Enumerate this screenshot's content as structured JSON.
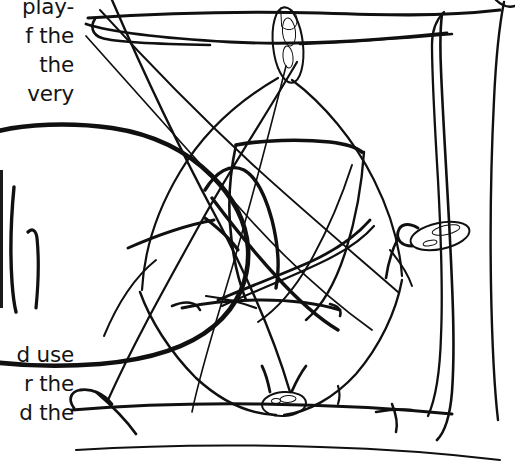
{
  "page": {
    "width": 515,
    "height": 468,
    "background_color": "#ffffff",
    "ink_color": "#101010",
    "text_color": "#141414"
  },
  "text_upper": {
    "name": "clipped-paragraph-upper",
    "note": "Left-clipped body text running down the left margin; only the right-hand ends of the lines are visible.",
    "lines": [
      "play-",
      "f the",
      "the",
      "very"
    ]
  },
  "text_lower": {
    "name": "clipped-paragraph-lower",
    "note": "Second left-clipped body text block below the drawing blob.",
    "lines": [
      "d use",
      "r the",
      "d the"
    ]
  },
  "drawing": {
    "name": "hand-drawn-ink-sketch",
    "description": "Loose ballpoint/ink sketch: an irregular frame of long wavering lines with crossing diagonals, a large closed blob outline at the left, an angular tangle of strokes at the centre, and three heavy solid ink blobs (top centre, right, bottom centre).",
    "stroke_color": "#101010",
    "blob_fill_color": "#0d0d0d",
    "elements": [
      {
        "label": "top-horizontal-rules",
        "type": "stroke-group",
        "count": 3
      },
      {
        "label": "left-closed-blob-outline",
        "type": "closed-outline"
      },
      {
        "label": "left-short-vertical-strokes",
        "type": "stroke-group",
        "count": 2
      },
      {
        "label": "centre-angular-tangle",
        "type": "stroke-group"
      },
      {
        "label": "right-vertical-channel-lines",
        "type": "stroke-group",
        "count": 2
      },
      {
        "label": "bottom-horizontal-rules",
        "type": "stroke-group",
        "count": 2
      },
      {
        "label": "ink-blob-top",
        "type": "solid-blob"
      },
      {
        "label": "ink-blob-right",
        "type": "solid-blob"
      },
      {
        "label": "ink-blob-bottom",
        "type": "solid-blob"
      }
    ]
  }
}
